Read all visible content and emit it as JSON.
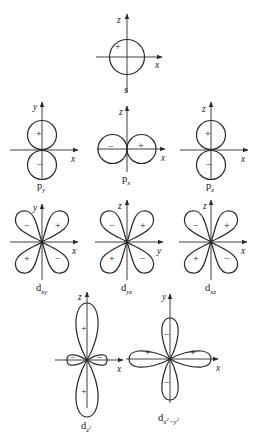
{
  "figure": {
    "orbitals": [
      {
        "id": "s",
        "label": "s",
        "subscript": "",
        "axes": {
          "vertical": "z",
          "horizontal": "x"
        },
        "signs": [
          "+"
        ]
      },
      {
        "id": "py",
        "label": "p",
        "subscript": "y",
        "axes": {
          "vertical": "y",
          "horizontal": "x"
        },
        "signs": [
          "+",
          "−"
        ]
      },
      {
        "id": "px",
        "label": "p",
        "subscript": "x",
        "axes": {
          "vertical": "z",
          "horizontal": "x"
        },
        "signs": [
          "−",
          "+"
        ]
      },
      {
        "id": "pz",
        "label": "p",
        "subscript": "z",
        "axes": {
          "vertical": "z",
          "horizontal": "x"
        },
        "signs": [
          "+",
          "−"
        ]
      },
      {
        "id": "dxy",
        "label": "d",
        "subscript": "xy",
        "axes": {
          "vertical": "y",
          "horizontal": "x"
        },
        "signs": [
          "−",
          "+",
          "+",
          "−"
        ]
      },
      {
        "id": "dyz",
        "label": "d",
        "subscript": "yz",
        "axes": {
          "vertical": "z",
          "horizontal": "y"
        },
        "signs": [
          "−",
          "+",
          "+",
          "−"
        ]
      },
      {
        "id": "dxz",
        "label": "d",
        "subscript": "xz",
        "axes": {
          "vertical": "z",
          "horizontal": "x"
        },
        "signs": [
          "−",
          "+",
          "+",
          "−"
        ]
      },
      {
        "id": "dz2",
        "label": "d",
        "subscript": "z",
        "superscript": "2",
        "axes": {
          "vertical": "z",
          "horizontal": "x"
        },
        "signs": [
          "+",
          "−",
          "−",
          "+"
        ]
      },
      {
        "id": "dx2y2",
        "label": "d",
        "subscript": "x",
        "sub_sup1": "2",
        "sub_mid": "−y",
        "sub_sup2": "2",
        "axes": {
          "vertical": "y",
          "horizontal": "x"
        },
        "signs": [
          "−",
          "+",
          "+",
          "−"
        ]
      }
    ]
  }
}
